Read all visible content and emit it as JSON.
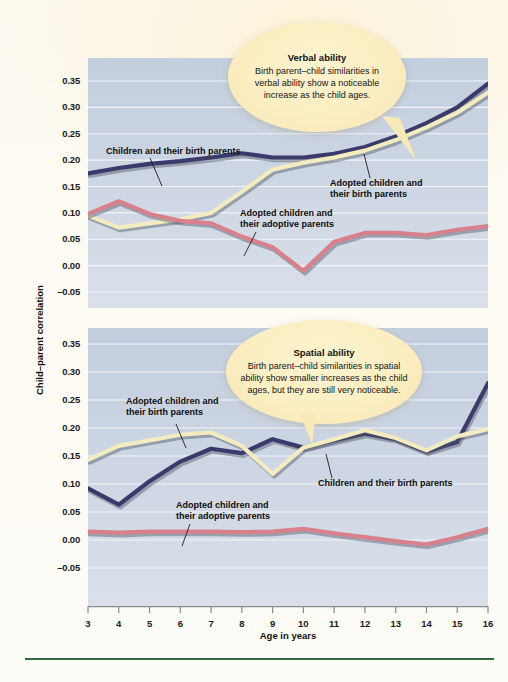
{
  "figure": {
    "y_axis_title": "Child–parent correlation",
    "x_axis_title": "Age in years"
  },
  "colors": {
    "birth_parents_navy": "#3b3b6b",
    "adopted_birth_yellow": "#f2ecc0",
    "adopted_adoptive_pink": "#d9808d",
    "plot_background": "#c8d2e0",
    "gridline": "#f2f5f9",
    "callout_fill": "#fbeec2",
    "page_background": "#fdfaf0",
    "bottom_rule": "#2f6b3c"
  },
  "callouts": {
    "verbal": {
      "title": "Verbal ability",
      "body": "Birth parent–child similarities in verbal ability show a noticeable increase as the child ages."
    },
    "spatial": {
      "title": "Spatial ability",
      "body": "Birth parent–child similarities in spatial ability show smaller increases as the child ages, but they are still very noticeable."
    }
  },
  "series_labels": {
    "children_birth": "Children and their birth parents",
    "adopted_birth": "Adopted children and\ntheir birth parents",
    "adopted_adoptive": "Adopted children and\ntheir adoptive parents"
  },
  "annotations": {
    "verbal_children_birth": "Children and their birth parents",
    "verbal_adopted_birth_l1": "Adopted children and",
    "verbal_adopted_birth_l2": "their birth parents",
    "verbal_adopted_adoptive_l1": "Adopted children and",
    "verbal_adopted_adoptive_l2": "their adoptive parents",
    "spatial_adopted_birth_l1": "Adopted children and",
    "spatial_adopted_birth_l2": "their birth parents",
    "spatial_children_birth": "Children and their birth parents",
    "spatial_adopted_adoptive_l1": "Adopted children and",
    "spatial_adopted_adoptive_l2": "their adoptive parents"
  },
  "chart_data": [
    {
      "type": "line",
      "title": "Verbal ability",
      "xlabel": "Age in years",
      "ylabel": "Child–parent correlation",
      "x": [
        3,
        4,
        5,
        6,
        7,
        8,
        9,
        10,
        11,
        12,
        13,
        14,
        15,
        16
      ],
      "xlim": [
        3,
        16
      ],
      "ylim": [
        -0.05,
        0.35
      ],
      "yticks": [
        -0.05,
        0.0,
        0.05,
        0.1,
        0.15,
        0.2,
        0.25,
        0.3,
        0.35
      ],
      "ytick_labels": [
        "–0.05",
        "0.00",
        "0.05",
        "0.10",
        "0.15",
        "0.20",
        "0.25",
        "0.30",
        "0.35"
      ],
      "xticks": [
        3,
        4,
        5,
        6,
        7,
        8,
        9,
        10,
        11,
        12,
        13,
        14,
        15,
        16
      ],
      "grid": true,
      "legend": "inline-annotations",
      "series": [
        {
          "name": "Children and their birth parents",
          "color": "#3b3b6b",
          "values": [
            0.175,
            0.185,
            0.193,
            0.198,
            0.205,
            0.213,
            0.205,
            0.205,
            0.212,
            0.225,
            0.245,
            0.27,
            0.3,
            0.345
          ]
        },
        {
          "name": "Adopted children and their birth parents",
          "color": "#f2ecc0",
          "values": [
            0.095,
            0.072,
            0.08,
            0.088,
            0.1,
            0.14,
            0.182,
            0.195,
            0.205,
            0.218,
            0.238,
            0.262,
            0.29,
            0.328
          ]
        },
        {
          "name": "Adopted children and their adoptive parents",
          "color": "#d9808d",
          "values": [
            0.098,
            0.122,
            0.098,
            0.085,
            0.08,
            0.055,
            0.035,
            -0.01,
            0.045,
            0.062,
            0.062,
            0.058,
            0.068,
            0.075
          ]
        }
      ]
    },
    {
      "type": "line",
      "title": "Spatial ability",
      "xlabel": "Age in years",
      "ylabel": "Child–parent correlation",
      "x": [
        3,
        4,
        5,
        6,
        7,
        8,
        9,
        10,
        11,
        12,
        13,
        14,
        15,
        16
      ],
      "xlim": [
        3,
        16
      ],
      "ylim": [
        -0.05,
        0.35
      ],
      "yticks": [
        -0.05,
        0.0,
        0.05,
        0.1,
        0.15,
        0.2,
        0.25,
        0.3,
        0.35
      ],
      "ytick_labels": [
        "–0.05",
        "0.00",
        "0.05",
        "0.10",
        "0.15",
        "0.20",
        "0.25",
        "0.30",
        "0.35"
      ],
      "xticks": [
        3,
        4,
        5,
        6,
        7,
        8,
        9,
        10,
        11,
        12,
        13,
        14,
        15,
        16
      ],
      "grid": true,
      "legend": "inline-annotations",
      "series": [
        {
          "name": "Children and their birth parents",
          "color": "#3b3b6b",
          "values": [
            0.092,
            0.063,
            0.105,
            0.14,
            0.163,
            0.155,
            0.18,
            0.165,
            0.178,
            0.19,
            0.18,
            0.158,
            0.175,
            0.28
          ]
        },
        {
          "name": "Adopted children and their birth parents",
          "color": "#f2ecc0",
          "values": [
            0.143,
            0.168,
            0.178,
            0.188,
            0.192,
            0.168,
            0.118,
            0.165,
            0.18,
            0.196,
            0.182,
            0.16,
            0.185,
            0.198
          ]
        },
        {
          "name": "Adopted children and their adoptive parents",
          "color": "#d9808d",
          "values": [
            0.015,
            0.013,
            0.015,
            0.015,
            0.015,
            0.014,
            0.015,
            0.02,
            0.012,
            0.005,
            -0.002,
            -0.008,
            0.005,
            0.02
          ]
        }
      ]
    }
  ]
}
